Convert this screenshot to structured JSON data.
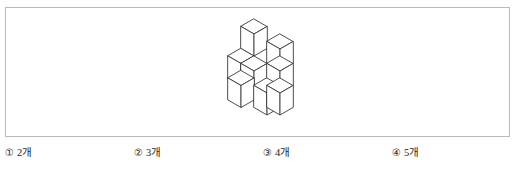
{
  "panel": {
    "border_color": "#b9b9b9",
    "background": "#ffffff"
  },
  "figure": {
    "name": "isometric-cube-stack",
    "stroke_color": "#3a3a3a",
    "face_top_color": "#ffffff",
    "face_left_color": "#ffffff",
    "face_right_color": "#ffffff",
    "visible_cube_count": 7
  },
  "options": [
    {
      "marker": "①",
      "text": "2개",
      "value": "2"
    },
    {
      "marker": "②",
      "text": "3개",
      "value": "3"
    },
    {
      "marker": "③",
      "text": "4개",
      "value": "4"
    },
    {
      "marker": "④",
      "text": "5개",
      "value": "5"
    }
  ]
}
